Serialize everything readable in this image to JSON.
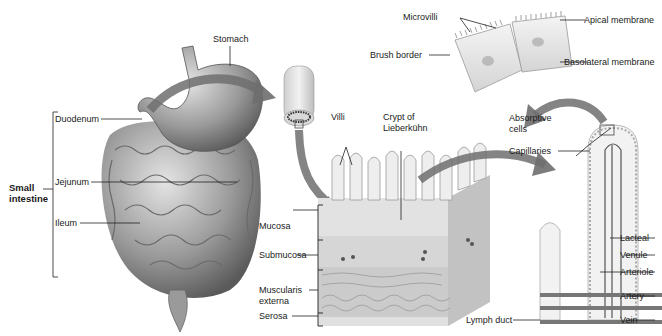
{
  "diagram": {
    "organ_labels": {
      "stomach": "Stomach",
      "small_intestine_line1": "Small",
      "small_intestine_line2": "intestine",
      "duodenum": "Duodenum",
      "jejunum": "Jejunum",
      "ileum": "Ileum"
    },
    "wall_layers": {
      "mucosa": "Mucosa",
      "submucosa": "Submucosa",
      "muscularis_line1": "Muscularis",
      "muscularis_line2": "externa",
      "serosa": "Serosa"
    },
    "villus_labels": {
      "villi": "Villi",
      "crypt_line1": "Crypt of",
      "crypt_line2": "Lieberkühn",
      "absorptive_line1": "Absorptive",
      "absorptive_line2": "cells",
      "capillaries": "Capillaries",
      "lacteal": "Lacteal",
      "venule": "Venule",
      "arteriole": "Arteriole",
      "artery": "Artery",
      "vein": "Vein",
      "lymph_duct": "Lymph duct"
    },
    "cell_labels": {
      "microvilli": "Microvilli",
      "apical_membrane": "Apical membrane",
      "brush_border": "Brush border",
      "basolateral_membrane": "Basolateral membrane"
    },
    "colors": {
      "organ": "#8a8a8a",
      "organ_light": "#c8c8c8",
      "arrow": "#6e6e6e",
      "tissue": "#d9d9d9",
      "leader": "#222222"
    }
  }
}
